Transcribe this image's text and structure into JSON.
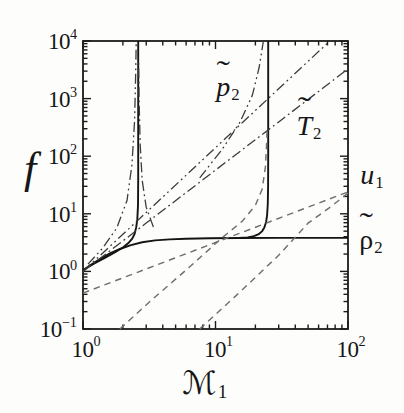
{
  "figure": {
    "background": "#fdfdfc",
    "tick_base": "10",
    "tilde_char": "˜"
  },
  "chart_data": {
    "type": "line",
    "scale": "log-log",
    "title": "",
    "xlabel_text": "M1",
    "ylabel_text": "f",
    "xlabel": {
      "letter": "ℳ",
      "sub": "1",
      "italic": false,
      "script": true
    },
    "ylabel": {
      "letter": "f",
      "italic": true
    },
    "xlim": [
      1,
      100
    ],
    "ylim": [
      0.1,
      10000
    ],
    "x_tick_exponents": [
      0,
      1,
      2
    ],
    "y_tick_exponents": [
      -1,
      0,
      1,
      2,
      3,
      4
    ],
    "grid": false,
    "legend": "inline-curve-labels",
    "style": {
      "axis_color": "#1b1b1b",
      "line_styles": {
        "solid": {
          "color": "#141414",
          "width": 1.9,
          "dash": ""
        },
        "dashdot": {
          "color": "#3c3c3c",
          "width": 1.3,
          "dash": "10 3.5 1.8 3.5"
        },
        "dashdotdot": {
          "color": "#3c3c3c",
          "width": 1.3,
          "dash": "10 3.5 1.8 3.5 1.8 3.5"
        },
        "dashed": {
          "color": "#6f6f6f",
          "width": 1.45,
          "dash": "6.5 5"
        }
      }
    },
    "series": [
      {
        "name": "rho2-low",
        "represents": "rho2",
        "style": "solid",
        "points": [
          [
            1,
            1.05
          ],
          [
            1.15,
            1.3
          ],
          [
            1.35,
            1.65
          ],
          [
            1.6,
            2.05
          ],
          [
            1.9,
            2.45
          ],
          [
            2.3,
            2.85
          ],
          [
            2.8,
            3.2
          ],
          [
            3.5,
            3.45
          ],
          [
            4.5,
            3.6
          ],
          [
            6,
            3.7
          ],
          [
            9,
            3.76
          ],
          [
            15,
            3.8
          ],
          [
            30,
            3.82
          ],
          [
            100,
            3.82
          ]
        ]
      },
      {
        "name": "rho2-crit1",
        "represents": "rho2",
        "style": "solid",
        "points": [
          [
            1,
            1.05
          ],
          [
            1.2,
            1.35
          ],
          [
            1.45,
            1.7
          ],
          [
            1.75,
            2.15
          ],
          [
            2.0,
            2.6
          ],
          [
            2.2,
            3.1
          ],
          [
            2.35,
            3.7
          ],
          [
            2.45,
            4.5
          ],
          [
            2.52,
            5.8
          ],
          [
            2.57,
            8
          ],
          [
            2.6,
            14
          ],
          [
            2.61,
            40
          ],
          [
            2.61,
            10000
          ]
        ]
      },
      {
        "name": "rho2-crit2",
        "represents": "rho2",
        "style": "solid",
        "points": [
          [
            15,
            3.8
          ],
          [
            17.5,
            3.9
          ],
          [
            19.5,
            4.1
          ],
          [
            21.2,
            4.45
          ],
          [
            22.5,
            5.0
          ],
          [
            23.4,
            5.8
          ],
          [
            24.1,
            7.2
          ],
          [
            24.5,
            9.5
          ],
          [
            24.8,
            15
          ],
          [
            24.95,
            30
          ],
          [
            25,
            120
          ],
          [
            25,
            10000
          ]
        ]
      },
      {
        "name": "p2-main",
        "represents": "p2",
        "style": "dashdotdot",
        "points": [
          [
            1,
            1
          ],
          [
            2,
            4.4
          ],
          [
            4,
            19.6
          ],
          [
            8,
            87
          ],
          [
            16,
            385
          ],
          [
            32,
            1700
          ],
          [
            73,
            10000
          ]
        ]
      },
      {
        "name": "p2-crit1",
        "represents": "p2",
        "style": "dashdotdot",
        "points": [
          [
            1.09,
            1.34
          ],
          [
            1.41,
            2.55
          ],
          [
            1.8,
            5.7
          ],
          [
            2.15,
            17
          ],
          [
            2.34,
            70
          ],
          [
            2.45,
            420
          ],
          [
            2.5,
            2800
          ],
          [
            2.52,
            10000
          ]
        ]
      },
      {
        "name": "p2-crit2",
        "represents": "p2",
        "style": "dashdotdot",
        "points": [
          [
            7.6,
            42
          ],
          [
            11.2,
            130
          ],
          [
            15.3,
            390
          ],
          [
            19,
            1150
          ],
          [
            21.3,
            3400
          ],
          [
            22.6,
            7800
          ],
          [
            23,
            10000
          ]
        ]
      },
      {
        "name": "T2-main",
        "represents": "T2",
        "style": "dashdot",
        "points": [
          [
            1,
            1
          ],
          [
            3,
            6.9
          ],
          [
            10,
            57.3
          ],
          [
            30,
            394
          ],
          [
            100,
            3280
          ]
        ]
      },
      {
        "name": "T2-crit1",
        "represents": "T2",
        "style": "dashdot",
        "points": [
          [
            3.4,
            5.9
          ],
          [
            3.0,
            13
          ],
          [
            2.8,
            38
          ],
          [
            2.7,
            156
          ],
          [
            2.65,
            940
          ],
          [
            2.63,
            4500
          ]
        ]
      },
      {
        "name": "u1-main",
        "represents": "u1",
        "style": "dashed",
        "points": [
          [
            1,
            0.42
          ],
          [
            100,
            24
          ]
        ]
      },
      {
        "name": "u1-crit2",
        "represents": "u1",
        "style": "dashed",
        "points": [
          [
            1.9,
            0.1
          ],
          [
            3.2,
            0.3
          ],
          [
            6.4,
            1.2
          ],
          [
            11,
            3.7
          ],
          [
            16,
            7.5
          ],
          [
            20,
            14
          ],
          [
            22.5,
            27
          ],
          [
            23.8,
            65
          ],
          [
            24.3,
            160
          ],
          [
            24.5,
            320
          ]
        ]
      },
      {
        "name": "u1-low",
        "represents": "u1",
        "style": "dashed",
        "points": [
          [
            7.6,
            0.1
          ],
          [
            15,
            0.42
          ],
          [
            30,
            1.9
          ],
          [
            50,
            6.9
          ],
          [
            75,
            13.5
          ],
          [
            100,
            23
          ]
        ]
      }
    ],
    "curve_labels": [
      {
        "id": "p2",
        "tilde": true,
        "letter": "p",
        "sub": "2",
        "italic": true,
        "px": [
          228,
          87
        ],
        "size": 28,
        "tilde_dy": "-0.08em"
      },
      {
        "id": "T2",
        "tilde": true,
        "letter": "T",
        "sub": "2",
        "italic": true,
        "px": [
          309,
          126
        ],
        "size": 28,
        "tilde_dy": "-0.22em"
      },
      {
        "id": "u1",
        "tilde": false,
        "letter": "u",
        "sub": "1",
        "italic": true,
        "px": [
          372,
          175
        ],
        "size": 28,
        "tilde_dy": "0"
      },
      {
        "id": "rho2",
        "tilde": true,
        "letter": "ρ",
        "sub": "2",
        "italic": false,
        "px": [
          371,
          240
        ],
        "size": 28,
        "tilde_dy": "-0.12em"
      }
    ],
    "layout": {
      "plot_box_px": {
        "left": 83,
        "top": 41,
        "right": 348,
        "bottom": 329
      },
      "tick_len_major": 8,
      "tick_len_minor": 4.5,
      "ylabel_px": [
        30,
        169
      ],
      "ylabel_size": 44,
      "xlabel_px": [
        205,
        383
      ],
      "xlabel_size": 32,
      "x_tick_label_y_offset": 7,
      "y_tick_label_x_offset": 6
    }
  }
}
